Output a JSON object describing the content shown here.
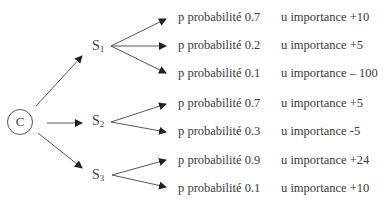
{
  "root": {
    "label": "C"
  },
  "strategies": [
    {
      "id": "s1",
      "label": "S",
      "sub": "1"
    },
    {
      "id": "s2",
      "label": "S",
      "sub": "2"
    },
    {
      "id": "s3",
      "label": "S",
      "sub": "3"
    }
  ],
  "outcomes": [
    {
      "strategy": "s1",
      "prob": "p probabilité 0.7",
      "util": "u importance +10"
    },
    {
      "strategy": "s1",
      "prob": "p probabilité 0.2",
      "util": "u importance +5"
    },
    {
      "strategy": "s1",
      "prob": "p probabilité 0.1",
      "util": "u importance – 100"
    },
    {
      "strategy": "s2",
      "prob": "p probabilité 0.7",
      "util": "u importance +5"
    },
    {
      "strategy": "s2",
      "prob": "p probabilité 0.3",
      "util": "u importance -5"
    },
    {
      "strategy": "s3",
      "prob": "p probabilité 0.9",
      "util": "u importance +24"
    },
    {
      "strategy": "s3",
      "prob": "p probabilité 0.1",
      "util": "u importance +10"
    }
  ],
  "colors": {
    "line": "#3a3a3a",
    "text": "#3a3a3a",
    "background": "#ffffff"
  }
}
